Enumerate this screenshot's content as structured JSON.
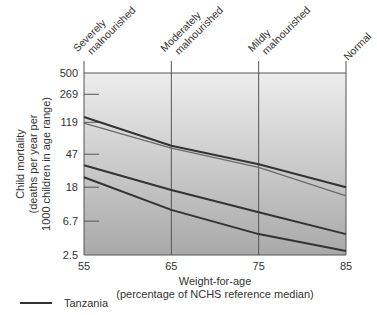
{
  "chart_data": {
    "type": "line",
    "title": "",
    "xlabel": "Weight-for-age",
    "xlabel_sub": "(percentage of NCHS reference median)",
    "ylabel": [
      "Child mortality",
      "(deaths per year per",
      "1000 children in age range)"
    ],
    "y_scale": "log",
    "ylim": [
      2.5,
      500
    ],
    "y_ticks": [
      "500",
      "269",
      "119",
      "47",
      "18",
      "6.7",
      "2.5"
    ],
    "y_tick_values": [
      500,
      269,
      119,
      47,
      18,
      6.7,
      2.5
    ],
    "x": [
      55,
      65,
      75,
      85
    ],
    "x_ticks": [
      "55",
      "65",
      "75",
      "85"
    ],
    "category_labels": [
      {
        "line1": "Severely",
        "line2": "malnourished",
        "x": 55
      },
      {
        "line1": "Moderately",
        "line2": "malnourished",
        "x": 65
      },
      {
        "line1": "Mildly",
        "line2": "malnourished",
        "x": 75
      },
      {
        "line1": "Normal",
        "line2": "",
        "x": 85
      }
    ],
    "grid": {
      "vertical_lines_at": [
        65,
        75
      ]
    },
    "series": [
      {
        "name": "Tanzania",
        "values": [
          139,
          60,
          35,
          18
        ],
        "color": "#333333",
        "width": 2
      },
      {
        "name": "Series 2",
        "values": [
          116,
          56,
          32,
          14
        ],
        "color": "#6a6a6a",
        "width": 1.3
      },
      {
        "name": "Series 3",
        "values": [
          34,
          16.6,
          8.7,
          4.6
        ],
        "color": "#333333",
        "width": 2
      },
      {
        "name": "Series 4",
        "values": [
          24,
          9.3,
          4.6,
          2.8
        ],
        "color": "#333333",
        "width": 2
      }
    ],
    "legend": [
      {
        "label": "Tanzania",
        "color": "#333333"
      }
    ],
    "legend_position": "bottom-left",
    "background_gradient": [
      "#ededed",
      "#a9a9a9"
    ]
  }
}
